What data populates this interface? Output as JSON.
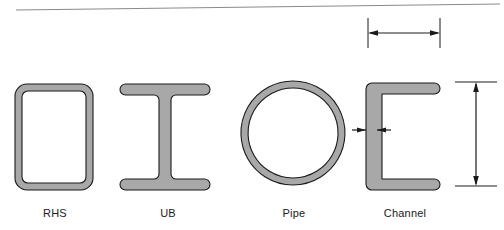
{
  "diagram": {
    "background_color": "#ffffff",
    "fill_color": "#a8a8a8",
    "stroke_color": "#1a1a1a",
    "dimension_color": "#1a1a1a",
    "rule_color": "#8a8a8a"
  },
  "sections": [
    {
      "key": "rhs",
      "label": "RHS",
      "shape": "rounded-rectangular-hollow-tube",
      "label_x": 55,
      "label_y": 215,
      "outer": {
        "x": 15,
        "y": 84,
        "width": 78,
        "height": 106,
        "radius": 12
      },
      "wall_thickness": 7
    },
    {
      "key": "ub",
      "label": "UB",
      "shape": "i-beam-universal-beam",
      "label_x": 168,
      "label_y": 215,
      "flange": {
        "x": 120,
        "y": 84,
        "width": 90,
        "height": 11
      },
      "web": {
        "x": 159,
        "width": 12
      },
      "bottom_flange_y": 179,
      "overall": {
        "x": 120,
        "y": 84,
        "width": 90,
        "height": 106
      }
    },
    {
      "key": "pipe",
      "label": "Pipe",
      "shape": "circular-hollow-section",
      "label_x": 294,
      "label_y": 215,
      "center": {
        "cx": 293,
        "cy": 133
      },
      "outer_radius": 52,
      "wall_thickness": 7
    },
    {
      "key": "channel",
      "label": "Channel",
      "shape": "c-channel-parallel-flange",
      "label_x": 405,
      "label_y": 215,
      "outer": {
        "x": 366,
        "y": 83,
        "width": 74,
        "height": 107
      },
      "web_thickness": 11,
      "flange_thickness": 11,
      "opening": "right"
    }
  ],
  "dimensions": [
    {
      "key": "width-dimension",
      "orientation": "horizontal",
      "arrow_y": 33,
      "x1": 368,
      "x2": 440,
      "extension_top": 18,
      "extension_bottom": 48,
      "value_text": ""
    },
    {
      "key": "thickness-dimension",
      "orientation": "horizontal-inward",
      "arrow_y": 130,
      "x1": 366,
      "x2": 377,
      "lead_length": 14,
      "value_text": ""
    },
    {
      "key": "height-dimension",
      "orientation": "vertical",
      "arrow_x": 476,
      "y1": 82,
      "y2": 186,
      "extension_left": 455,
      "extension_right": 497,
      "value_text": ""
    }
  ],
  "rule_line": {
    "key": "top-border-rule",
    "x1": 16,
    "y1": 10,
    "x2": 500,
    "y2": 4
  }
}
